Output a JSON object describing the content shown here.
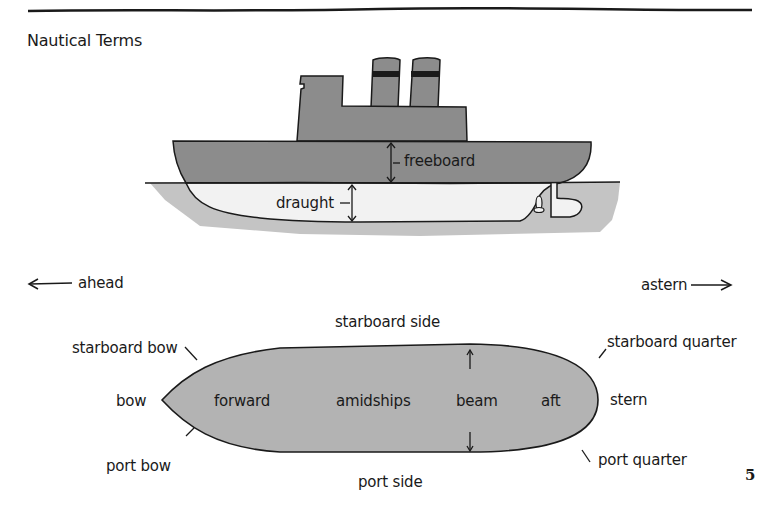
{
  "page": {
    "title": "Nautical Terms",
    "page_number": "5"
  },
  "side_view": {
    "labels": {
      "freeboard": "freeboard",
      "draught": "draught"
    }
  },
  "directions": {
    "ahead": "ahead",
    "astern": "astern"
  },
  "top_view": {
    "labels": {
      "starboard_side": "starboard side",
      "port_side": "port side",
      "starboard_bow": "starboard bow",
      "starboard_quarter": "starboard quarter",
      "bow": "bow",
      "stern": "stern",
      "port_bow": "port bow",
      "port_quarter": "port quarter",
      "forward": "forward",
      "amidships": "amidships",
      "beam": "beam",
      "aft": "aft"
    }
  },
  "colors": {
    "hull_above": "#8c8c8c",
    "hull_below": "#f2f2f2",
    "water": "#c4c4c4",
    "deck_plan": "#b3b3b3",
    "ink": "#1a1a1a"
  }
}
